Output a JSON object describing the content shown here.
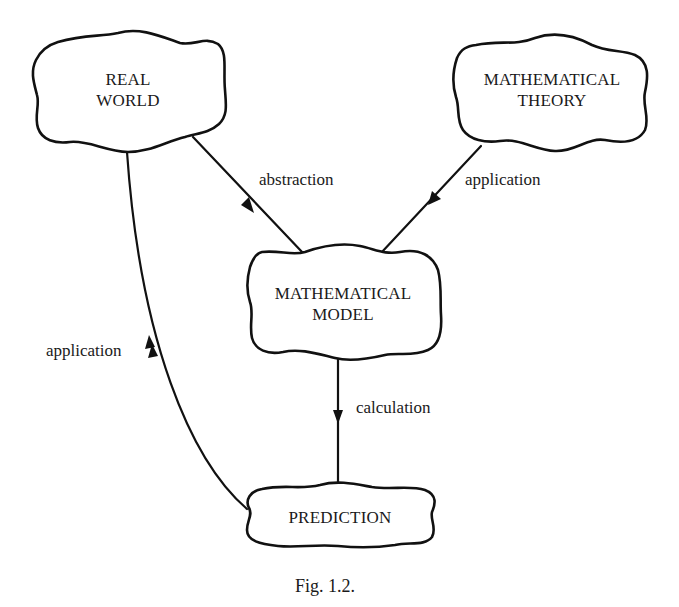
{
  "figure": {
    "caption": "Fig. 1.2.",
    "stroke_color": "#111111",
    "background_color": "#ffffff"
  },
  "nodes": {
    "real_world": {
      "line1": "REAL",
      "line2": "WORLD"
    },
    "mathematical_theory": {
      "line1": "MATHEMATICAL",
      "line2": "THEORY"
    },
    "mathematical_model": {
      "line1": "MATHEMATICAL",
      "line2": "MODEL"
    },
    "prediction": {
      "line1": "PREDICTION"
    }
  },
  "edges": [
    {
      "from": "REAL WORLD",
      "to": "MATHEMATICAL MODEL",
      "label": "abstraction"
    },
    {
      "from": "MATHEMATICAL THEORY",
      "to": "MATHEMATICAL MODEL",
      "label": "application"
    },
    {
      "from": "MATHEMATICAL MODEL",
      "to": "PREDICTION",
      "label": "calculation"
    },
    {
      "from": "PREDICTION",
      "to": "REAL WORLD",
      "label": "application"
    }
  ]
}
